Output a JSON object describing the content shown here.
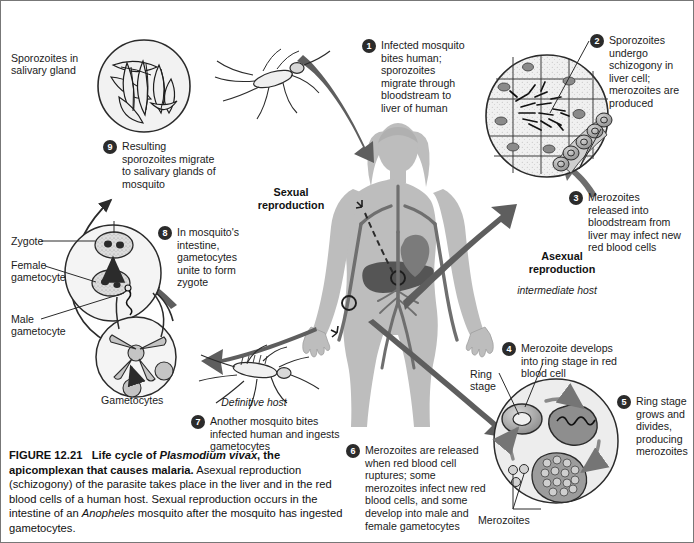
{
  "figure": {
    "number": "FIGURE 12.21",
    "title_part1": "Life cycle of ",
    "title_species": "Plasmodium vivax",
    "title_part2": ", the apicomplexan that causes malaria.",
    "body_part1": " Asexual reproduction (schizogony) of the parasite takes place in the liver and in the red blood cells of a human host. Sexual reproduction occurs in the intestine of an ",
    "body_species": "Anopheles",
    "body_part2": " mosquito after the mosquito has ingested gametocytes."
  },
  "steps": [
    {
      "num": "1",
      "text": "Infected mosquito bites human; sporozoites migrate through bloodstream to liver of human"
    },
    {
      "num": "2",
      "text": "Sporozoites undergo schizogony in liver cell; merozoites are produced"
    },
    {
      "num": "3",
      "text": "Merozoites released into bloodstream from liver may infect new red blood cells"
    },
    {
      "num": "4",
      "text": "Merozoite develops into ring stage in red blood cell"
    },
    {
      "num": "5",
      "text": "Ring stage grows and divides, producing merozoites"
    },
    {
      "num": "6",
      "text": "Merozoites are released when red blood cell ruptures; some merozoites infect new red blood cells, and some develop into male and female gametocytes"
    },
    {
      "num": "7",
      "text": "Another mosquito bites infected human and ingests gametocytes"
    },
    {
      "num": "8",
      "text": "In mosquito's intestine, gametocytes unite to form zygote"
    },
    {
      "num": "9",
      "text": "Resulting sporozoites migrate to salivary glands of mosquito"
    }
  ],
  "labels": {
    "sporozoites_gland": "Sporozoites in\nsalivary gland",
    "zygote": "Zygote",
    "female_gametocyte": "Female\ngametocyte",
    "male_gametocyte": "Male\ngametocyte",
    "gametocytes": "Gametocytes",
    "ring_stage": "Ring\nstage",
    "merozoites": "Merozoites",
    "sexual_reproduction": "Sexual\nreproduction",
    "asexual_reproduction": "Asexual\nreproduction",
    "definitive_host": "Definitive host",
    "intermediate_host": "intermediate host"
  },
  "colors": {
    "arrow_dark": "#5e5e5e",
    "arrow_mid": "#6e6e6e",
    "body_fill": "#b9b9b9",
    "vessel": "#6f6f6f",
    "cell_fill": "#e4e4e4",
    "stroke": "#2b2b2b",
    "text": "#1b1b1b",
    "badge": "#2b2b2b"
  }
}
